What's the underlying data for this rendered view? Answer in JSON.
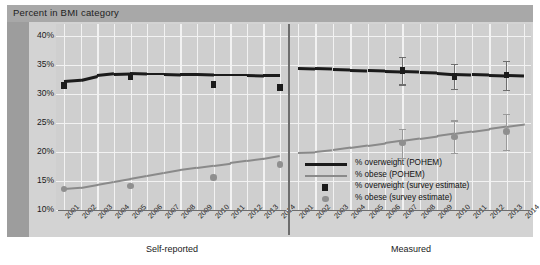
{
  "title": "Percent in BMI category",
  "panels": [
    {
      "name": "Self-reported",
      "label": "Self-reported"
    },
    {
      "name": "Measured",
      "label": "Measured"
    }
  ],
  "legend": {
    "items": [
      {
        "key": "overweight_pohem",
        "label": "% overweight (POHEM)",
        "marker": "line",
        "color": "#1b1b1b"
      },
      {
        "key": "obese_pohem",
        "label": "% obese (POHEM)",
        "marker": "line",
        "color": "#8a8a8a"
      },
      {
        "key": "overweight_survey",
        "label": "% overweight (survey estimate)",
        "marker": "square",
        "color": "#1b1b1b"
      },
      {
        "key": "obese_survey",
        "label": "% obese (survey estimate)",
        "marker": "circle",
        "color": "#8f8f8f"
      }
    ]
  },
  "chart_data": {
    "type": "line",
    "title": "Percent in BMI category",
    "xlabel": "",
    "ylabel": "Percent in BMI category",
    "ylim": [
      10,
      42
    ],
    "ytick_values": [
      40,
      35,
      30,
      25,
      20,
      15,
      10
    ],
    "ytick_labels": [
      "40%",
      "35%",
      "30%",
      "25%",
      "20%",
      "15%",
      "10%"
    ],
    "grid": true,
    "legend_position": "inside-right-lower",
    "panel_labels": [
      "Self-reported",
      "Measured"
    ],
    "x": [
      2001,
      2002,
      2003,
      2004,
      2005,
      2006,
      2007,
      2008,
      2009,
      2010,
      2011,
      2012,
      2013,
      2014
    ],
    "xtick_labels": [
      "2001",
      "2002",
      "2003",
      "2004",
      "2005",
      "2006",
      "2007",
      "2008",
      "2009",
      "2010",
      "2011",
      "2012",
      "2013",
      "2014"
    ],
    "panels": [
      {
        "name": "Self-reported",
        "series": [
          {
            "name": "% overweight (POHEM)",
            "type": "line",
            "color": "#1b1b1b",
            "x": [
              2001,
              2002,
              2003,
              2004,
              2005,
              2006,
              2007,
              2008,
              2009,
              2010,
              2011,
              2012,
              2013,
              2014
            ],
            "values": [
              32.2,
              32.4,
              33.1,
              33.4,
              33.5,
              33.4,
              33.4,
              33.3,
              33.3,
              33.2,
              33.2,
              33.2,
              33.1,
              33.1
            ]
          },
          {
            "name": "% obese (POHEM)",
            "type": "line",
            "color": "#8a8a8a",
            "x": [
              2001,
              2002,
              2003,
              2004,
              2005,
              2006,
              2007,
              2008,
              2009,
              2010,
              2011,
              2012,
              2013,
              2014
            ],
            "values": [
              13.6,
              13.8,
              14.3,
              14.8,
              15.3,
              15.8,
              16.3,
              16.8,
              17.2,
              17.6,
              18.0,
              18.4,
              18.8,
              19.3
            ]
          },
          {
            "name": "% overweight (survey estimate)",
            "type": "scatter",
            "marker": "square",
            "color": "#1b1b1b",
            "x": [
              2001,
              2005,
              2010,
              2014
            ],
            "values": [
              31.4,
              32.9,
              31.6,
              31.1
            ]
          },
          {
            "name": "% obese (survey estimate)",
            "type": "scatter",
            "marker": "circle",
            "color": "#8f8f8f",
            "x": [
              2001,
              2005,
              2010,
              2014
            ],
            "values": [
              13.6,
              14.1,
              15.6,
              17.8
            ]
          }
        ]
      },
      {
        "name": "Measured",
        "series": [
          {
            "name": "% overweight (POHEM)",
            "type": "line",
            "color": "#1b1b1b",
            "x": [
              2001,
              2002,
              2003,
              2004,
              2005,
              2006,
              2007,
              2008,
              2009,
              2010,
              2011,
              2012,
              2013,
              2014
            ],
            "values": [
              34.4,
              34.3,
              34.2,
              34.1,
              34.0,
              33.9,
              33.8,
              33.7,
              33.6,
              33.4,
              33.3,
              33.2,
              33.1,
              33.0
            ]
          },
          {
            "name": "% obese (POHEM)",
            "type": "line",
            "color": "#8a8a8a",
            "x": [
              2001,
              2002,
              2003,
              2004,
              2005,
              2006,
              2007,
              2008,
              2009,
              2010,
              2011,
              2012,
              2013,
              2014
            ],
            "values": [
              19.8,
              19.9,
              20.2,
              20.6,
              21.0,
              21.4,
              21.8,
              22.2,
              22.6,
              23.0,
              23.4,
              23.8,
              24.2,
              24.6
            ]
          },
          {
            "name": "% overweight (survey estimate)",
            "type": "scatter",
            "marker": "square",
            "color": "#1b1b1b",
            "x": [
              2007,
              2010,
              2013
            ],
            "values": [
              34.0,
              33.0,
              33.2
            ],
            "error_low": [
              31.6,
              30.8,
              30.7
            ],
            "error_high": [
              36.4,
              35.2,
              35.7
            ]
          },
          {
            "name": "% obese (survey estimate)",
            "type": "scatter",
            "marker": "circle",
            "color": "#8f8f8f",
            "x": [
              2007,
              2010,
              2013
            ],
            "values": [
              21.5,
              22.6,
              23.5
            ],
            "error_low": [
              19.0,
              19.8,
              20.3
            ],
            "error_high": [
              24.0,
              25.4,
              26.6
            ]
          }
        ]
      }
    ]
  }
}
